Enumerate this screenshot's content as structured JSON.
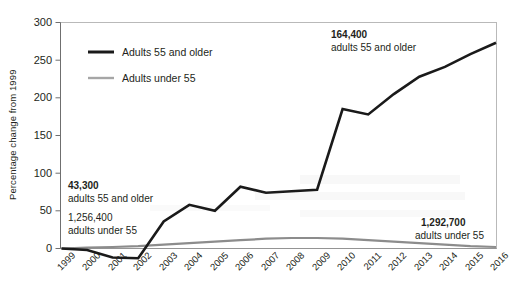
{
  "chart_data": {
    "type": "line",
    "title": "",
    "xlabel": "",
    "ylabel": "Percentage change from 1999",
    "ylim": [
      -20,
      300
    ],
    "yticks": [
      0,
      50,
      100,
      150,
      200,
      250,
      300
    ],
    "ytick_labels": [
      "0",
      "50",
      "100",
      "150",
      "200",
      "250",
      "300"
    ],
    "grid": false,
    "legend_position": "upper-left-inside",
    "categories": [
      "1999",
      "2000",
      "2001",
      "2002",
      "2003",
      "2004",
      "2005",
      "2006",
      "2007",
      "2008",
      "2009",
      "2010",
      "2011",
      "2012",
      "2013",
      "2014",
      "2015",
      "2016"
    ],
    "series": [
      {
        "name": "Adults 55 and older",
        "color": "#1a1a1a",
        "values": [
          0,
          -2,
          -12,
          -13,
          36,
          58,
          50,
          82,
          74,
          76,
          78,
          185,
          178,
          205,
          228,
          241,
          258,
          273
        ]
      },
      {
        "name": "Adults under 55",
        "color": "#8c8c8c",
        "values": [
          0,
          1,
          2,
          3,
          5,
          7,
          9,
          11,
          13,
          14,
          14,
          13,
          11,
          9,
          7,
          5,
          3,
          2
        ]
      }
    ],
    "annotations": [
      {
        "id": "left-old",
        "value": "43,300",
        "label": "adults 55 and older",
        "bold": true
      },
      {
        "id": "left-young",
        "value": "1,256,400",
        "label": "adults under 55",
        "bold": false
      },
      {
        "id": "right-old",
        "value": "164,400",
        "label": "adults 55 and older",
        "bold": true
      },
      {
        "id": "right-young",
        "value": "1,292,700",
        "label": "adults under 55",
        "bold": true
      }
    ]
  },
  "legend": {
    "items": [
      {
        "label": "Adults 55 and older",
        "color": "#1a1a1a"
      },
      {
        "label": "Adults under 55",
        "color": "#a6a6a6"
      }
    ]
  }
}
